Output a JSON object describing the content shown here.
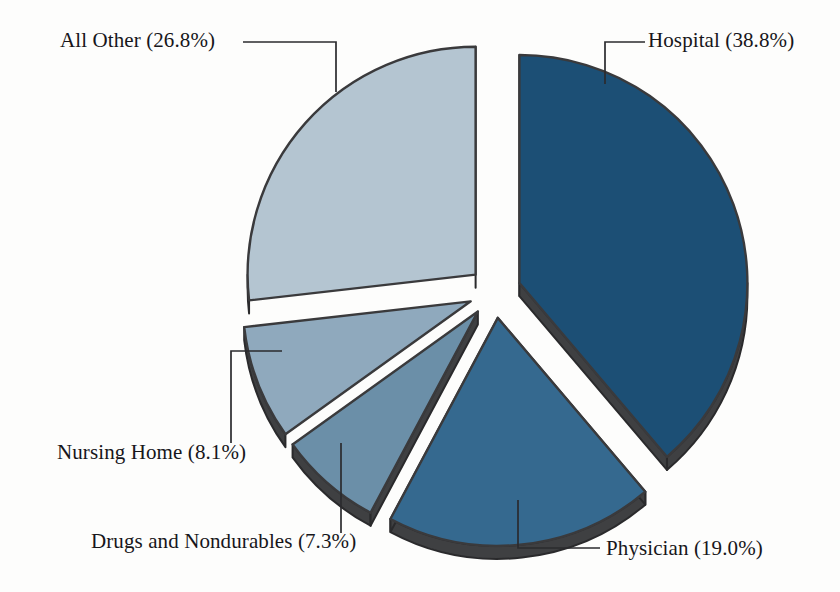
{
  "chart_data": {
    "type": "pie",
    "title": "",
    "subtitle": "",
    "xlabel": "",
    "ylabel": "",
    "legend_position": "none",
    "grid": false,
    "exploded": true,
    "start_angle_deg": 0,
    "direction": "clockwise",
    "categories": [
      "Hospital",
      "Physician",
      "Drugs and Nondurables",
      "Nursing Home",
      "All Other"
    ],
    "values": [
      38.8,
      19.0,
      7.3,
      8.1,
      26.8
    ],
    "units": "percent",
    "slices": [
      {
        "id": "hospital",
        "name": "Hospital",
        "value": 38.8,
        "label": "Hospital (38.8%)",
        "color": "#1c4f75",
        "edge_color": "#3a3a3c",
        "start_deg": 0.0,
        "end_deg": 139.68
      },
      {
        "id": "physician",
        "name": "Physician",
        "value": 19.0,
        "label": "Physician (19.0%)",
        "color": "#35698f",
        "edge_color": "#3a3a3c",
        "start_deg": 139.68,
        "end_deg": 208.08
      },
      {
        "id": "drugs-and-nondurables",
        "name": "Drugs and Nondurables",
        "value": 7.3,
        "label": "Drugs and Nondurables (7.3%)",
        "color": "#6b8fa8",
        "edge_color": "#3a3a3c",
        "start_deg": 208.08,
        "end_deg": 234.36
      },
      {
        "id": "nursing-home",
        "name": "Nursing Home",
        "value": 8.1,
        "label": "Nursing Home (8.1%)",
        "color": "#8fa9bd",
        "edge_color": "#3a3a3c",
        "start_deg": 234.36,
        "end_deg": 263.52
      },
      {
        "id": "all-other",
        "name": "All Other",
        "value": 26.8,
        "label": "All Other (26.8%)",
        "color": "#b4c5d1",
        "edge_color": "#3a3a3c",
        "start_deg": 263.52,
        "end_deg": 360.0
      }
    ]
  },
  "labels": {
    "all_other": "All Other (26.8%)",
    "hospital": "Hospital (38.8%)",
    "physician": "Physician (19.0%)",
    "drugs": "Drugs and Nondurables (7.3%)",
    "nursing": "Nursing Home (8.1%)"
  },
  "colors": {
    "background": "#fdfdfc",
    "text": "#17161a",
    "leader_line": "#2b2b2e",
    "slice_outline": "#2a2a2c",
    "hospital": "#1c4f75",
    "physician": "#35698f",
    "drugs": "#6b8fa8",
    "nursing": "#8fa9bd",
    "all_other": "#b4c5d1"
  }
}
